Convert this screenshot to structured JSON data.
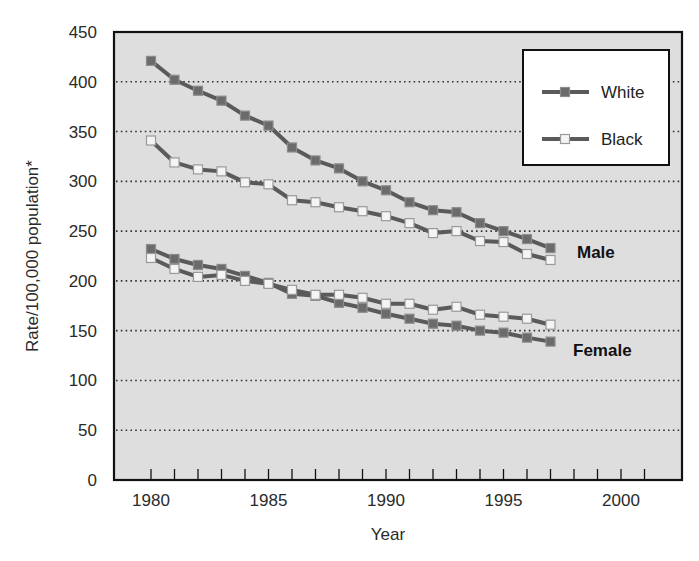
{
  "chart_data": {
    "type": "line",
    "title": "",
    "xlabel": "Year",
    "ylabel": "Rate/100,000 population*",
    "xlim": [
      1978.4,
      2002.6
    ],
    "ylim": [
      0,
      450
    ],
    "x_ticks": [
      1980,
      1985,
      1990,
      1995,
      2000
    ],
    "x_minor_ticks_every": 1,
    "y_ticks": [
      0,
      50,
      100,
      150,
      200,
      250,
      300,
      350,
      400,
      450
    ],
    "grid": "horizontal dotted",
    "legend_position": "upper right",
    "x": [
      1980,
      1981,
      1982,
      1983,
      1984,
      1985,
      1986,
      1987,
      1988,
      1989,
      1990,
      1991,
      1992,
      1993,
      1994,
      1995,
      1996,
      1997
    ],
    "series": [
      {
        "name": "White",
        "group": "Male",
        "marker": "filled-dark-square",
        "values": [
          421,
          402,
          391,
          381,
          366,
          356,
          334,
          321,
          313,
          300,
          291,
          279,
          271,
          269,
          258,
          250,
          242,
          233
        ]
      },
      {
        "name": "Black",
        "group": "Male",
        "marker": "open-light-square",
        "values": [
          341,
          319,
          312,
          310,
          299,
          297,
          281,
          279,
          274,
          270,
          265,
          258,
          248,
          250,
          240,
          239,
          227,
          221
        ]
      },
      {
        "name": "White",
        "group": "Female",
        "marker": "filled-dark-square",
        "values": [
          232,
          222,
          216,
          212,
          205,
          198,
          187,
          185,
          178,
          173,
          167,
          162,
          157,
          155,
          150,
          148,
          143,
          139
        ]
      },
      {
        "name": "Black",
        "group": "Female",
        "marker": "open-light-square",
        "values": [
          223,
          212,
          204,
          206,
          200,
          197,
          191,
          186,
          186,
          183,
          177,
          177,
          171,
          174,
          166,
          164,
          162,
          156
        ]
      }
    ],
    "annotations": [
      {
        "text": "Male",
        "x": 1998,
        "y": 233
      },
      {
        "text": "Female",
        "x": 1998,
        "y": 135
      }
    ],
    "legend": [
      {
        "label": "White",
        "marker": "filled-dark-square"
      },
      {
        "label": "Black",
        "marker": "open-light-square"
      }
    ]
  },
  "colors": {
    "plot_background": "#dedede",
    "line": "#5a5a5a",
    "white_marker_fill": "#6b6b6b",
    "white_marker_stroke": "#8c8c8c",
    "black_marker_fill": "#f4f4f4",
    "black_marker_stroke": "#9a9a9a",
    "axis": "#111111",
    "grid": "#333333"
  }
}
